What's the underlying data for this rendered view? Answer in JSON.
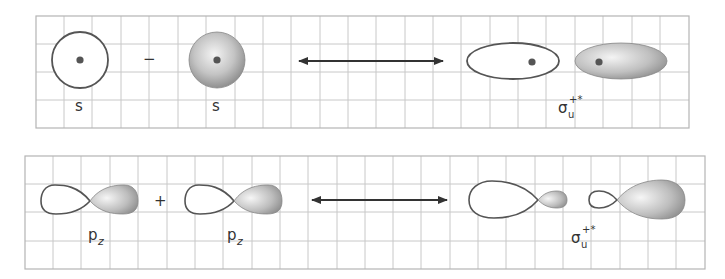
{
  "diagram": {
    "type": "molecular-orbital-combination",
    "colors": {
      "grid_line": "#c8c8c8",
      "panel_border": "#b4b4b4",
      "outline": "#555555",
      "nucleus": "#555555",
      "shade_light": "#f2f2f2",
      "shade_dark": "#8a8a8a",
      "arrow": "#333333"
    },
    "panels": [
      {
        "id": "s-orbital-panel",
        "operator": "−",
        "left_label": "s",
        "right_label": "s",
        "result_label": {
          "base": "σ",
          "superscript": "+*",
          "subscript": "u"
        }
      },
      {
        "id": "pz-orbital-panel",
        "operator": "+",
        "left_label": {
          "base": "p",
          "subscript": "z"
        },
        "right_label": {
          "base": "p",
          "subscript": "z"
        },
        "result_label": {
          "base": "σ",
          "superscript": "+*",
          "subscript": "u"
        }
      }
    ]
  },
  "labels": {
    "top_s1": "s",
    "top_s2": "s",
    "top_op": "−",
    "top_sigma": "σ",
    "top_sigma_sup": "+*",
    "top_sigma_sub": "u",
    "bot_p1": "p",
    "bot_p1_sub": "z",
    "bot_p2": "p",
    "bot_p2_sub": "z",
    "bot_op": "+",
    "bot_sigma": "σ",
    "bot_sigma_sup": "+*",
    "bot_sigma_sub": "u"
  }
}
